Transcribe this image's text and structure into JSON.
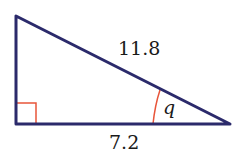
{
  "diagram": {
    "type": "right-triangle",
    "hypotenuse_label": "11.8",
    "base_label": "7.2",
    "angle_label": "q",
    "colors": {
      "edge": "#2b2a6b",
      "marker": "#e8553a",
      "text": "#1a1a1a"
    }
  }
}
